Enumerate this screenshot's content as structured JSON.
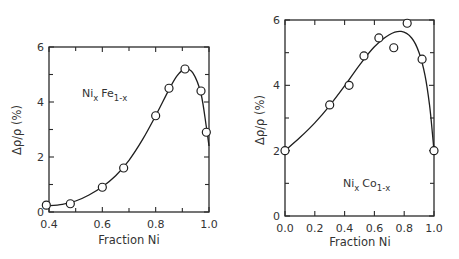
{
  "chart_data": [
    {
      "type": "scatter",
      "title": "",
      "annotation": {
        "base1": "Ni",
        "sub1": "x",
        "base2": "Fe",
        "sub2": "1-x"
      },
      "xlabel": "Fraction Ni",
      "ylabel": "Δρ/ρ (%)",
      "xlim": [
        0.4,
        1.0
      ],
      "ylim": [
        0,
        6
      ],
      "xticks": [
        "0.4",
        "0.6",
        "0.8",
        "1.0"
      ],
      "yticks": [
        "0",
        "2",
        "4",
        "6"
      ],
      "grid": false,
      "legend": null,
      "series": [
        {
          "name": "NixFe1-x (measured)",
          "marker": "open-circle",
          "x": [
            0.39,
            0.48,
            0.6,
            0.68,
            0.8,
            0.85,
            0.91,
            0.97,
            0.99
          ],
          "y": [
            0.25,
            0.3,
            0.9,
            1.6,
            3.5,
            4.5,
            5.2,
            4.4,
            2.9
          ]
        }
      ],
      "fit_curve": {
        "x": [
          0.39,
          0.45,
          0.5,
          0.55,
          0.6,
          0.65,
          0.7,
          0.75,
          0.8,
          0.85,
          0.88,
          0.91,
          0.94,
          0.97,
          0.99,
          1.0
        ],
        "y": [
          0.22,
          0.28,
          0.4,
          0.62,
          0.92,
          1.32,
          1.88,
          2.62,
          3.5,
          4.45,
          4.95,
          5.2,
          5.05,
          4.3,
          3.1,
          2.4
        ]
      }
    },
    {
      "type": "scatter",
      "title": "",
      "annotation": {
        "base1": "Ni",
        "sub1": "x",
        "base2": "Co",
        "sub2": "1-x"
      },
      "xlabel": "Fraction Ni",
      "ylabel": "Δρ/ρ (%)",
      "xlim": [
        0.0,
        1.0
      ],
      "ylim": [
        0,
        6
      ],
      "xticks": [
        "0.0",
        "0.2",
        "0.4",
        "0.6",
        "0.8",
        "1.0"
      ],
      "yticks": [
        "0",
        "2",
        "4",
        "6"
      ],
      "grid": false,
      "legend": null,
      "series": [
        {
          "name": "NixCo1-x (measured)",
          "marker": "open-circle",
          "x": [
            0.0,
            0.3,
            0.43,
            0.53,
            0.63,
            0.73,
            0.82,
            0.92,
            1.0
          ],
          "y": [
            2.0,
            3.4,
            4.0,
            4.9,
            5.45,
            5.15,
            5.9,
            4.8,
            2.0
          ]
        }
      ],
      "fit_curve": {
        "x": [
          0.0,
          0.1,
          0.2,
          0.3,
          0.4,
          0.5,
          0.6,
          0.7,
          0.78,
          0.85,
          0.9,
          0.94,
          0.97,
          0.99,
          1.0
        ],
        "y": [
          2.0,
          2.4,
          2.85,
          3.38,
          3.98,
          4.62,
          5.18,
          5.55,
          5.65,
          5.45,
          5.0,
          4.3,
          3.4,
          2.5,
          2.0
        ]
      }
    }
  ]
}
